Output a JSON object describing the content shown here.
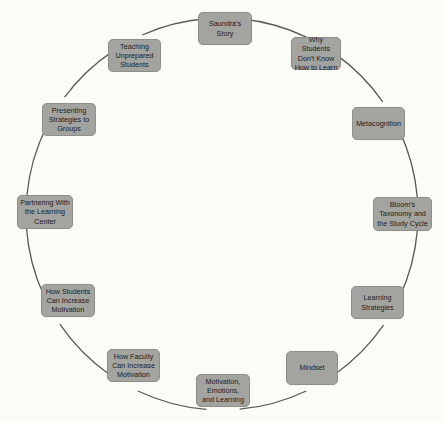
{
  "diagram": {
    "type": "cycle",
    "line_color": "#5a5a58",
    "node_fill": "#a3a3a0",
    "background": "#fcfcf7",
    "circle": {
      "cx": 222,
      "cy": 214,
      "r": 196
    },
    "nodes": [
      {
        "id": "saundras-story",
        "label": "Saundra's Story",
        "x": 198,
        "y": 12,
        "w": 54,
        "h": 33
      },
      {
        "id": "why-students-dont-know",
        "label": "Why Students\nDon't Know\nHow to Learn",
        "x": 291,
        "y": 37,
        "w": 50,
        "h": 33
      },
      {
        "id": "metacognition",
        "label": "Metacognition",
        "x": 352,
        "y": 107,
        "w": 53,
        "h": 33
      },
      {
        "id": "blooms-taxonomy",
        "label": "Bloom's\nTaxonomy and\nthe Study Cycle",
        "x": 373,
        "y": 197,
        "w": 59,
        "h": 34
      },
      {
        "id": "learning-strategies",
        "label": "Learning\nStrategies",
        "x": 351,
        "y": 286,
        "w": 53,
        "h": 33
      },
      {
        "id": "mindset",
        "label": "Mindset",
        "x": 286,
        "y": 351,
        "w": 52,
        "h": 34
      },
      {
        "id": "motivation-emotions-learning",
        "label": "Motivation,\nEmotions,\nand Learning",
        "x": 196,
        "y": 374,
        "w": 54,
        "h": 33
      },
      {
        "id": "how-faculty-increase-motivation",
        "label": "How Faculty\nCan Increase\nMotivation",
        "x": 107,
        "y": 349,
        "w": 53,
        "h": 33
      },
      {
        "id": "how-students-increase-motivation",
        "label": "How Students\nCan Increase\nMotivation",
        "x": 41,
        "y": 284,
        "w": 54,
        "h": 33
      },
      {
        "id": "partnering-learning-center",
        "label": "Partnering With\nthe Learning\nCenter",
        "x": 17,
        "y": 195,
        "w": 56,
        "h": 34
      },
      {
        "id": "presenting-strategies-groups",
        "label": "Presenting\nStrategies to\nGroups",
        "x": 42,
        "y": 103,
        "w": 54,
        "h": 33
      },
      {
        "id": "teaching-unprepared-students",
        "label": "Teaching\nUnprepared\nStudents",
        "x": 108,
        "y": 39,
        "w": 53,
        "h": 33
      }
    ]
  }
}
